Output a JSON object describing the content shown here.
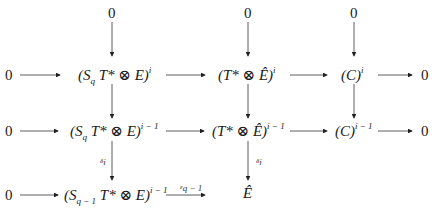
{
  "diagram": {
    "type": "commutative-diagram",
    "zero": "0",
    "rows": [
      {
        "row": "top",
        "nodes": [
          "0",
          "0",
          "0"
        ]
      },
      {
        "row": "1",
        "left_zero": "0",
        "n1": {
          "base": "(S",
          "sub": "q",
          "rest": " T* ⊗ E)",
          "sup": "i"
        },
        "n2": {
          "base": "(T* ⊗ Ê)",
          "sup": "i"
        },
        "n3": {
          "base": "(C)",
          "sup": "i"
        },
        "right_zero": "0"
      },
      {
        "row": "2",
        "left_zero": "0",
        "n1": {
          "base": "(S",
          "sub": "q",
          "rest": " T* ⊗ E)",
          "sup": "i − 1"
        },
        "n2": {
          "base": "(T* ⊗ Ê)",
          "sup": "i − 1"
        },
        "n3": {
          "base": "(C)",
          "sup": "i − 1"
        },
        "right_zero": "0"
      },
      {
        "row": "3",
        "left_zero": "0",
        "n1": {
          "base": "(S",
          "sub": "q − 1",
          "rest": " T* ⊗ E)",
          "sup": "i − 1"
        },
        "n2": {
          "base": "Ê"
        }
      }
    ],
    "arrow_labels": {
      "delta_left": {
        "base": "δ",
        "sub": "i"
      },
      "delta_right": {
        "base": "δ",
        "sub": "i"
      },
      "epsilon": {
        "base": "ε",
        "sub": "q − 1"
      }
    }
  }
}
